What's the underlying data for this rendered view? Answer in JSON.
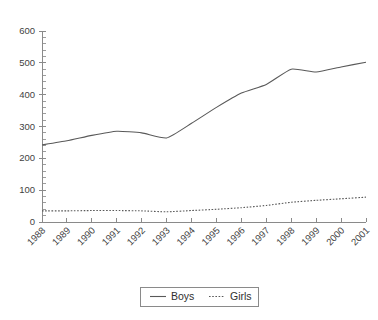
{
  "chart_data": {
    "type": "line",
    "title": "",
    "subtitle": "",
    "xlabel": "",
    "ylabel": "",
    "categories": [
      "1988",
      "1989",
      "1990",
      "1991",
      "1992",
      "1993",
      "1994",
      "1995",
      "1996",
      "1997",
      "1998",
      "1999",
      "2000",
      "2001"
    ],
    "series": [
      {
        "name": "Boys",
        "style": "solid",
        "color": "#595959",
        "values": [
          242,
          255,
          272,
          285,
          280,
          264,
          310,
          360,
          405,
          432,
          480,
          471,
          487,
          502
        ]
      },
      {
        "name": "Girls",
        "style": "dotted",
        "color": "#595959",
        "values": [
          35,
          35,
          36,
          36,
          35,
          32,
          36,
          40,
          45,
          52,
          62,
          68,
          73,
          78
        ]
      }
    ],
    "ylim": [
      0,
      600
    ],
    "ytick_values": [
      0,
      100,
      200,
      300,
      400,
      500,
      600
    ],
    "ytick_labels": [
      "0",
      "100",
      "200",
      "300",
      "400",
      "500",
      "600"
    ],
    "y_minor_interval": 20,
    "grid": false,
    "smoothing": true,
    "xtick_rotation_deg": 45,
    "legend": {
      "position": "bottom",
      "bordered": true,
      "entries": [
        {
          "label": "Boys",
          "style": "solid"
        },
        {
          "label": "Girls",
          "style": "dotted"
        }
      ]
    },
    "axis_color": "#8a8a8a",
    "text_color": "#3f3f3f",
    "background": "#ffffff"
  }
}
